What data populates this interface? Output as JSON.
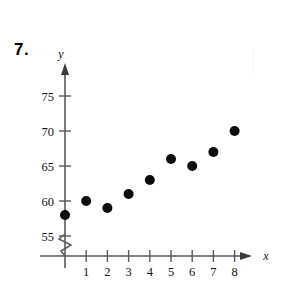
{
  "problem": {
    "number": "7."
  },
  "chart_data": {
    "type": "scatter",
    "title": "",
    "xlabel": "x",
    "ylabel": "y",
    "x": [
      0,
      1,
      2,
      3,
      4,
      5,
      6,
      7,
      8
    ],
    "values": [
      58,
      60,
      59,
      61,
      63,
      66,
      65,
      67,
      70
    ],
    "points": [
      {
        "x": 0,
        "y": 58
      },
      {
        "x": 1,
        "y": 60
      },
      {
        "x": 2,
        "y": 59
      },
      {
        "x": 3,
        "y": 61
      },
      {
        "x": 4,
        "y": 63
      },
      {
        "x": 5,
        "y": 66
      },
      {
        "x": 6,
        "y": 65
      },
      {
        "x": 7,
        "y": 67
      },
      {
        "x": 8,
        "y": 70
      }
    ],
    "x_tick_labels": [
      "1",
      "2",
      "3",
      "4",
      "5",
      "6",
      "7",
      "8"
    ],
    "x_ticks": [
      1,
      2,
      3,
      4,
      5,
      6,
      7,
      8
    ],
    "y_tick_labels": [
      "55",
      "60",
      "65",
      "70",
      "75"
    ],
    "y_ticks": [
      55,
      60,
      65,
      70,
      75
    ],
    "xlim": [
      0,
      8.6
    ],
    "ylim": [
      53,
      77
    ],
    "grid": false,
    "legend": false,
    "axis_break": {
      "axis": "y",
      "below_value": 55,
      "style": "zigzag"
    },
    "marker": {
      "shape": "circle",
      "color": "#0b0b0b",
      "size": 5
    },
    "axis_color": "#5a5a5a",
    "arrows": [
      "x",
      "y"
    ]
  }
}
